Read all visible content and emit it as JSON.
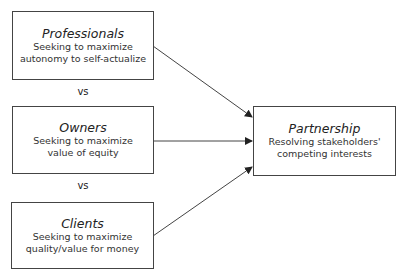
{
  "stakeholders": [
    {
      "title": "Professionals",
      "line1": "Seeking to maximize",
      "line2": "autonomy to self-actualize"
    },
    {
      "title": "Owners",
      "line1": "Seeking to maximize",
      "line2": "value of equity"
    },
    {
      "title": "Clients",
      "line1": "Seeking to maximize",
      "line2": "quality/value for money"
    }
  ],
  "separators": [
    "vs",
    "vs"
  ],
  "result": {
    "title": "Partnership",
    "line1": "Resolving stakeholders'",
    "line2": "competing interests"
  },
  "colors": {
    "line": "#444444",
    "text": "#222222"
  }
}
